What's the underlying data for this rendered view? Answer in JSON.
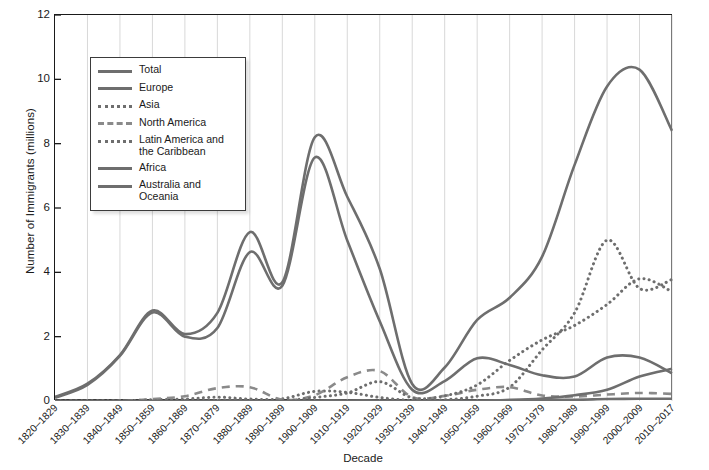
{
  "chart_data": {
    "type": "line",
    "title": "",
    "xlabel": "Decade",
    "ylabel": "Number of Immigrants (millions)",
    "ylim": [
      0,
      12
    ],
    "yticks": [
      0,
      2,
      4,
      6,
      8,
      10,
      12
    ],
    "grid": "vertical",
    "legend_position": "upper-left-inside",
    "categories": [
      "1820–1829",
      "1830–1839",
      "1840–1849",
      "1850–1859",
      "1860–1869",
      "1870–1879",
      "1880–1889",
      "1890–1899",
      "1900–1909",
      "1910–1919",
      "1920–1929",
      "1930–1939",
      "1940–1949",
      "1950–1959",
      "1960–1969",
      "1970–1979",
      "1980–1989",
      "1990–1999",
      "2000–2009",
      "2010–2017"
    ],
    "series": [
      {
        "name": "Total",
        "style": "solid",
        "color": "#6e6e6e",
        "values": [
          0.13,
          0.54,
          1.43,
          2.81,
          2.08,
          2.74,
          5.25,
          3.69,
          8.2,
          6.35,
          4.11,
          0.53,
          1.04,
          2.52,
          3.21,
          4.49,
          7.34,
          9.78,
          10.3,
          8.4
        ]
      },
      {
        "name": "Europe",
        "style": "solid",
        "color": "#6e6e6e",
        "values": [
          0.1,
          0.5,
          1.4,
          2.75,
          2.0,
          2.27,
          4.63,
          3.58,
          7.57,
          4.99,
          2.48,
          0.35,
          0.62,
          1.33,
          1.12,
          0.8,
          0.76,
          1.35,
          1.35,
          0.86
        ]
      },
      {
        "name": "Asia",
        "style": "dotted",
        "color": "#6e6e6e",
        "values": [
          0.0,
          0.0,
          0.0,
          0.04,
          0.06,
          0.12,
          0.06,
          0.07,
          0.3,
          0.27,
          0.11,
          0.02,
          0.04,
          0.15,
          0.43,
          1.59,
          2.74,
          5.0,
          3.5,
          3.78
        ]
      },
      {
        "name": "North America",
        "style": "dashed",
        "color": "#8a8a8a",
        "values": [
          0.0,
          0.0,
          0.0,
          0.06,
          0.15,
          0.4,
          0.43,
          0.04,
          0.18,
          0.74,
          0.93,
          0.12,
          0.16,
          0.35,
          0.43,
          0.17,
          0.14,
          0.2,
          0.25,
          0.22
        ]
      },
      {
        "name": "Latin America and the Caribbean",
        "style": "dotted",
        "color": "#6e6e6e",
        "values": [
          0.0,
          0.01,
          0.01,
          0.01,
          0.01,
          0.02,
          0.03,
          0.01,
          0.11,
          0.25,
          0.6,
          0.1,
          0.16,
          0.5,
          1.26,
          1.9,
          2.35,
          3.0,
          3.8,
          3.4
        ]
      },
      {
        "name": "Africa",
        "style": "solid",
        "color": "#6e6e6e",
        "values": [
          0.0,
          0.0,
          0.0,
          0.0,
          0.0,
          0.0,
          0.0,
          0.0,
          0.01,
          0.01,
          0.01,
          0.0,
          0.01,
          0.01,
          0.03,
          0.08,
          0.18,
          0.35,
          0.76,
          1.0
        ]
      },
      {
        "name": "Australia and Oceania",
        "style": "solid",
        "color": "#6e6e6e",
        "values": [
          0.0,
          0.0,
          0.0,
          0.0,
          0.0,
          0.01,
          0.01,
          0.0,
          0.01,
          0.01,
          0.01,
          0.0,
          0.01,
          0.01,
          0.03,
          0.04,
          0.04,
          0.06,
          0.07,
          0.07
        ]
      }
    ]
  },
  "axes": {
    "ylabel": "Number of Immigrants (millions)",
    "xlabel": "Decade",
    "ytick_labels": [
      "12",
      "10",
      "8",
      "6",
      "4",
      "2",
      "0"
    ]
  },
  "legend": {
    "items": [
      {
        "label": "Total",
        "style": "solid"
      },
      {
        "label": "Europe",
        "style": "solid"
      },
      {
        "label": "Asia",
        "style": "dotted"
      },
      {
        "label": "North America",
        "style": "dashed"
      },
      {
        "label": "Latin America and the Caribbean",
        "style": "dotted"
      },
      {
        "label": "Africa",
        "style": "solid"
      },
      {
        "label": "Australia and Oceania",
        "style": "solid"
      }
    ]
  },
  "source_note": "Data from: United States Census Bureau and Department of Homeland Security, 2017. Visualization by E.H. Fouberg and A.B. Murphy, © 2020 John Wiley & Sons, Inc.",
  "colors": {
    "line": "#6e6e6e",
    "dash_line": "#8a8a8a",
    "axis": "#1a1a1a",
    "grid": "#d8d8d8",
    "background": "#ffffff"
  }
}
